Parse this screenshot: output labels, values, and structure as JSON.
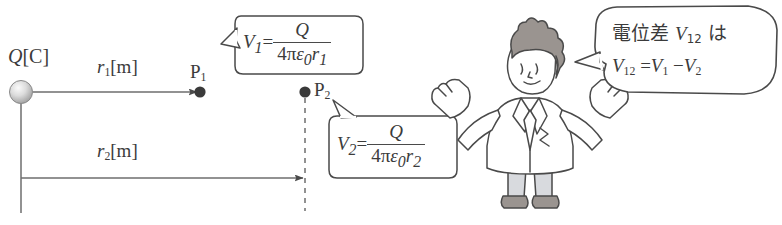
{
  "figure": {
    "background_color": "#ffffff",
    "line_color": "#4a4a4a",
    "text_color": "#3b3b3b"
  },
  "charge": {
    "label_symbol": "Q",
    "label_unit": "[C]",
    "color": "#c9c9c9"
  },
  "distances": [
    {
      "symbol": "r",
      "index": "1",
      "unit": "[m]"
    },
    {
      "symbol": "r",
      "index": "2",
      "unit": "[m]"
    }
  ],
  "points": [
    {
      "label": "P",
      "index": "1"
    },
    {
      "label": "P",
      "index": "2"
    }
  ],
  "formulas": {
    "v1": {
      "lhs": "V",
      "lhs_index": "1",
      "equals": "=",
      "numerator": "Q",
      "denominator_prefix": "4",
      "denominator_pi": "π",
      "denominator_eps": "ε",
      "denominator_eps_index": "0",
      "denominator_r": "r",
      "denominator_r_index": "1"
    },
    "v2": {
      "lhs": "V",
      "lhs_index": "2",
      "equals": "=",
      "numerator": "Q",
      "denominator_prefix": "4",
      "denominator_pi": "π",
      "denominator_eps": "ε",
      "denominator_eps_index": "0",
      "denominator_r": "r",
      "denominator_r_index": "2"
    }
  },
  "speech": {
    "line1_prefix": "電位差",
    "line1_symbol": "V",
    "line1_symbol_index": "12",
    "line1_suffix": "は",
    "line2_lhs": "V",
    "line2_lhs_index": "12",
    "line2_equals": "=",
    "line2_rhs1": "V",
    "line2_rhs1_index": "1",
    "line2_minus": "−",
    "line2_rhs2": "V",
    "line2_rhs2_index": "2"
  },
  "character": {
    "name": "scientist",
    "hair_color": "#9a9490",
    "coat_color": "#ffffff",
    "legs_color": "#d8dade",
    "shoes_color": "#8e8e8e",
    "outline_color": "#4a4a4a"
  }
}
